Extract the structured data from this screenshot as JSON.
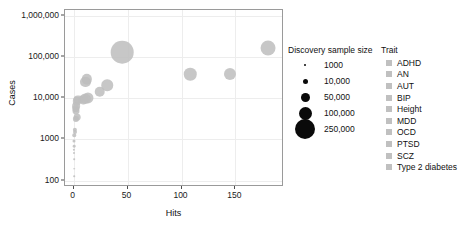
{
  "chart_data": {
    "type": "scatter",
    "title": "",
    "xlabel": "Hits",
    "ylabel": "Cases",
    "xlim": [
      -8,
      195
    ],
    "ylim": [
      70,
      1400000
    ],
    "yscale": "log",
    "xticks": [
      0,
      50,
      100,
      150
    ],
    "xtick_labels": [
      "0",
      "50",
      "100",
      "150"
    ],
    "yticks": [
      100,
      1000,
      10000,
      100000,
      1000000
    ],
    "ytick_labels": [
      "100",
      "1000",
      "10,000",
      "100,000",
      "1,000,000"
    ],
    "grid": true,
    "legend_position": "right",
    "point_color": "#bdbdbd",
    "size_legend": {
      "title": "Discovery sample size",
      "entries": [
        {
          "label": "1000",
          "value": 1000,
          "diameter_px": 2
        },
        {
          "label": "10,000",
          "value": 10000,
          "diameter_px": 5
        },
        {
          "label": "50,000",
          "value": 50000,
          "diameter_px": 9
        },
        {
          "label": "100,000",
          "value": 100000,
          "diameter_px": 13
        },
        {
          "label": "250,000",
          "value": 250000,
          "diameter_px": 20
        }
      ]
    },
    "trait_legend": {
      "title": "Trait",
      "entries": [
        {
          "label": "ADHD",
          "color": "#c0c0c0"
        },
        {
          "label": "AN",
          "color": "#c0c0c0"
        },
        {
          "label": "AUT",
          "color": "#c0c0c0"
        },
        {
          "label": "BIP",
          "color": "#c0c0c0"
        },
        {
          "label": "Height",
          "color": "#c0c0c0"
        },
        {
          "label": "MDD",
          "color": "#c0c0c0"
        },
        {
          "label": "OCD",
          "color": "#c0c0c0"
        },
        {
          "label": "PTSD",
          "color": "#c0c0c0"
        },
        {
          "label": "SCZ",
          "color": "#c0c0c0"
        },
        {
          "label": "Type 2 diabetes",
          "color": "#c0c0c0"
        }
      ]
    },
    "points": [
      {
        "trait": "Height",
        "hits": 45,
        "cases": 133000,
        "size": 253000
      },
      {
        "trait": "Type 2 diabetes",
        "hits": 180,
        "cases": 170000,
        "size": 110000
      },
      {
        "trait": "SCZ",
        "hits": 108,
        "cases": 38000,
        "size": 77000
      },
      {
        "trait": "SCZ",
        "hits": 145,
        "cases": 40000,
        "size": 72000
      },
      {
        "trait": "MDD",
        "hits": 31,
        "cases": 21000,
        "size": 66000
      },
      {
        "trait": "MDD",
        "hits": 24,
        "cases": 14500,
        "size": 55000
      },
      {
        "trait": "SCZ",
        "hits": 12,
        "cases": 29000,
        "size": 53000
      },
      {
        "trait": "SCZ",
        "hits": 11,
        "cases": 25000,
        "size": 50000
      },
      {
        "trait": "BIP",
        "hits": 13,
        "cases": 10200,
        "size": 61000
      },
      {
        "trait": "BIP",
        "hits": 11,
        "cases": 9800,
        "size": 54000
      },
      {
        "trait": "BIP",
        "hits": 9,
        "cases": 9000,
        "size": 42000
      },
      {
        "trait": "ADHD",
        "hits": 4,
        "cases": 9300,
        "size": 38000
      },
      {
        "trait": "ADHD",
        "hits": 3,
        "cases": 8400,
        "size": 34000
      },
      {
        "trait": "AN",
        "hits": 2.5,
        "cases": 6500,
        "size": 30000
      },
      {
        "trait": "AN",
        "hits": 2,
        "cases": 5600,
        "size": 27000
      },
      {
        "trait": "AN",
        "hits": 2,
        "cases": 4900,
        "size": 24000
      },
      {
        "trait": "AUT",
        "hits": 3,
        "cases": 3500,
        "size": 22000
      },
      {
        "trait": "AUT",
        "hits": 2,
        "cases": 3100,
        "size": 19000
      },
      {
        "trait": "OCD",
        "hits": 1,
        "cases": 1700,
        "size": 9000
      },
      {
        "trait": "OCD",
        "hits": 1,
        "cases": 1500,
        "size": 8000
      },
      {
        "trait": "OCD",
        "hits": 0.8,
        "cases": 1250,
        "size": 6000
      },
      {
        "trait": "PTSD",
        "hits": 0.6,
        "cases": 900,
        "size": 4500
      },
      {
        "trait": "PTSD",
        "hits": 0.6,
        "cases": 700,
        "size": 3500
      },
      {
        "trait": "PTSD",
        "hits": 0.5,
        "cases": 560,
        "size": 2600
      },
      {
        "trait": "PTSD",
        "hits": 0.5,
        "cases": 480,
        "size": 2000
      },
      {
        "trait": "OCD",
        "hits": 0.4,
        "cases": 330,
        "size": 1400
      },
      {
        "trait": "PTSD",
        "hits": 0.3,
        "cases": 195,
        "size": 1000
      },
      {
        "trait": "PTSD",
        "hits": 0.3,
        "cases": 130,
        "size": 1000
      }
    ]
  }
}
